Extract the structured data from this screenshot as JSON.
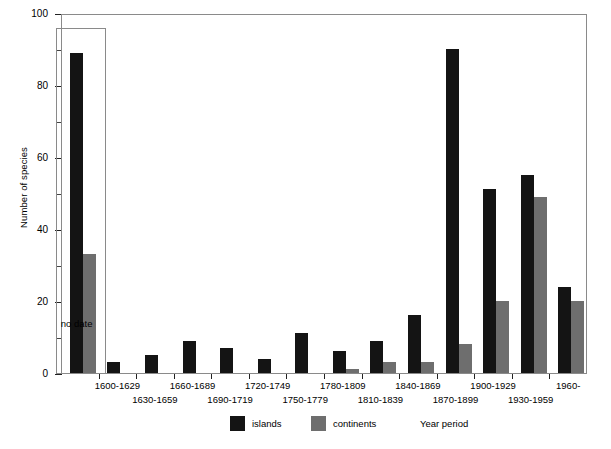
{
  "chart_data": {
    "type": "bar",
    "title": "",
    "xlabel": "Year period",
    "ylabel": "Number of species",
    "ylim": [
      0,
      100
    ],
    "ytick_labels": [
      "0",
      "20",
      "40",
      "60",
      "80",
      "100"
    ],
    "ytick_values": [
      0,
      20,
      40,
      60,
      80,
      100
    ],
    "yminor_values": [
      10,
      30,
      50,
      70,
      90
    ],
    "grid": false,
    "legend_position": "bottom-center",
    "annotations": [
      {
        "text": "no date",
        "target_category": "no date"
      }
    ],
    "categories": [
      "no date",
      "1600-1629",
      "1630-1659",
      "1660-1689",
      "1690-1719",
      "1720-1749",
      "1750-1779",
      "1780-1809",
      "1810-1839",
      "1840-1869",
      "1870-1899",
      "1900-1929",
      "1930-1959",
      "1960-"
    ],
    "series": [
      {
        "name": "islands",
        "color": "#141414",
        "values": [
          89,
          3,
          5,
          9,
          7,
          4,
          11,
          6,
          9,
          16,
          90,
          51,
          55,
          24
        ]
      },
      {
        "name": "continents",
        "color": "#6e6e6e",
        "values": [
          33,
          0,
          0,
          0,
          0,
          0,
          0,
          1,
          3,
          3,
          8,
          20,
          49,
          20
        ]
      }
    ]
  },
  "legend": {
    "items": [
      {
        "label": "islands",
        "color": "#141414"
      },
      {
        "label": "continents",
        "color": "#6e6e6e"
      }
    ]
  },
  "axes": {
    "y_title": "Number of species",
    "x_title": "Year period"
  },
  "colors": {
    "islands": "#141414",
    "continents": "#6e6e6e",
    "frame": "#8a8a8a",
    "background": "#ffffff"
  }
}
